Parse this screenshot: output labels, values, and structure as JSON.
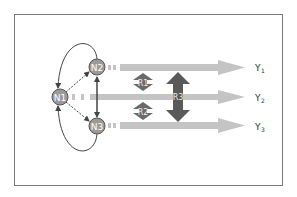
{
  "diagram": {
    "nodes": [
      {
        "id": "N1",
        "label": "N1"
      },
      {
        "id": "N2",
        "label": "N2"
      },
      {
        "id": "N3",
        "label": "N3"
      }
    ],
    "relations": [
      {
        "id": "R1",
        "label": "R1"
      },
      {
        "id": "R2",
        "label": "R2"
      },
      {
        "id": "R3",
        "label": "R3"
      }
    ],
    "outputs": [
      {
        "id": "Y1",
        "label": "Y",
        "sub": "1"
      },
      {
        "id": "Y2",
        "label": "Y",
        "sub": "2"
      },
      {
        "id": "Y3",
        "label": "Y",
        "sub": "3"
      }
    ],
    "colors": {
      "frame": "#7a7a7a",
      "node_fill": "#9a9a9a",
      "arrow_fill": "#c4c4c4",
      "relation_fill": "#6a6a6a",
      "relation_big_fill": "#5a5a5a",
      "line": "#444444"
    }
  }
}
